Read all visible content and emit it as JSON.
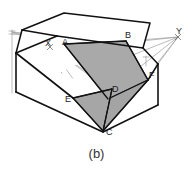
{
  "figure": {
    "caption": "(b)",
    "type": "perspective-construction-drawing",
    "background_color": "#ffffff",
    "outline_color": "#111111",
    "construction_line_color": "#9a9a9a",
    "shade_color_main": "#a9a9a9",
    "shade_color_lower": "#a2a2a2",
    "vertex_labels": [
      {
        "id": "A",
        "text": "A",
        "x": 62,
        "y": 43
      },
      {
        "id": "B",
        "text": "B",
        "x": 126,
        "y": 37
      },
      {
        "id": "C",
        "text": "C",
        "x": 105,
        "y": 132
      },
      {
        "id": "D",
        "text": "D",
        "x": 111,
        "y": 87
      },
      {
        "id": "E",
        "text": "E",
        "x": 70,
        "y": 97
      },
      {
        "id": "F",
        "text": "F",
        "x": 148,
        "y": 76
      }
    ],
    "vanishing_points": [
      {
        "id": "X",
        "text": "X",
        "x": 45,
        "y": 42
      },
      {
        "id": "Y",
        "text": "Y",
        "x": 176,
        "y": 30
      }
    ],
    "geometry": {
      "top_face": "57,36 64,13 150,23 143,48",
      "upper_left_band": "16,53 57,36 64,13 22,30",
      "front_lower_face": "16,53 16,92 103,132 103,92",
      "right_lower_face": "103,92 103,132 158,105 158,64",
      "shaded_quad": "64,44 126,41 148,80 107,99",
      "shaded_lower_tri": "73,98 112,89 103,131",
      "shaded_small_tri": "107,99 103,131 148,80"
    }
  }
}
